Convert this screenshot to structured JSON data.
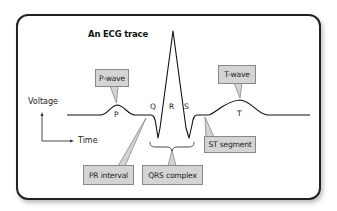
{
  "title": "An ECG trace",
  "axes": {
    "y_label": "Voltage",
    "x_label": "Time"
  },
  "wave_letters": {
    "p": "P",
    "q": "Q",
    "r": "R",
    "s": "S",
    "t": "T"
  },
  "callouts": {
    "p_wave": "P-wave",
    "t_wave": "T-wave",
    "pr_interval": "PR interval",
    "qrs_complex": "QRS complex",
    "st_segment": "ST segment"
  },
  "colors": {
    "callout_fill": "#d4d4d4",
    "callout_border": "#888888",
    "trace": "#111111",
    "frame": "#222222"
  }
}
